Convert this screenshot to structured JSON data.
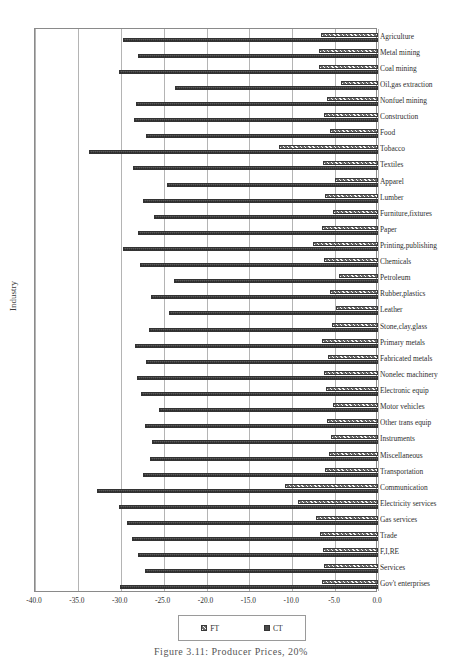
{
  "chart_data": {
    "type": "bar",
    "orientation": "horizontal",
    "title": "",
    "xlabel": "",
    "ylabel": "Industry",
    "xlim": [
      -40.0,
      0.0
    ],
    "xticks": [
      "-40.0",
      "-35.0",
      "-30.0",
      "-25.0",
      "-20.0",
      "-15.0",
      "-10.0",
      "-5.0",
      "0.0"
    ],
    "xtick_values": [
      -40,
      -35,
      -30,
      -25,
      -20,
      -15,
      -10,
      -5,
      0
    ],
    "grid": true,
    "legend_position": "below-axis",
    "categories": [
      "Agriculture",
      "Metal mining",
      "Coal mining",
      "Oil,gas extraction",
      "Nonfuel mining",
      "Construction",
      "Food",
      "Tobacco",
      "Textiles",
      "Apparel",
      "Lumber",
      "Furniture,fixtures",
      "Paper",
      "Printing,publishing",
      "Chemicals",
      "Petroleum",
      "Rubber,plastics",
      "Leather",
      "Stone,clay,glass",
      "Primary metals",
      "Fabricated metals",
      "Nonelec machinery",
      "Electronic equip",
      "Motor vehicles",
      "Other trans equip",
      "Instruments",
      "Miscellaneous",
      "Transportation",
      "Communication",
      "Electricity services",
      "Gas services",
      "Trade",
      "F,I,RE",
      "Services",
      "Gov't enterprises"
    ],
    "series": [
      {
        "name": "FT",
        "pattern": "hatched",
        "color": "#6e6e6e",
        "values": [
          -6.6,
          -6.9,
          -6.9,
          -4.3,
          -5.9,
          -6.3,
          -5.6,
          -11.5,
          -6.4,
          -5.0,
          -6.2,
          -5.3,
          -6.5,
          -7.6,
          -6.3,
          -4.6,
          -5.6,
          -4.9,
          -5.4,
          -6.5,
          -5.8,
          -6.3,
          -6.1,
          -5.3,
          -5.9,
          -5.5,
          -5.7,
          -6.2,
          -10.8,
          -9.3,
          -7.2,
          -6.8,
          -6.4,
          -6.3,
          -6.5
        ]
      },
      {
        "name": "CT",
        "pattern": "solid-checker",
        "color": "#5a5a5a",
        "values": [
          -29.7,
          -28.0,
          -30.2,
          -23.7,
          -28.2,
          -28.4,
          -27.1,
          -33.7,
          -28.6,
          -24.6,
          -27.4,
          -26.1,
          -28.0,
          -29.7,
          -27.7,
          -23.8,
          -26.5,
          -24.4,
          -26.7,
          -28.3,
          -27.0,
          -28.1,
          -27.6,
          -25.5,
          -27.2,
          -26.3,
          -26.6,
          -27.4,
          -32.8,
          -30.2,
          -29.3,
          -28.7,
          -28.0,
          -27.2,
          -30.1
        ]
      }
    ],
    "legend": [
      {
        "label": "FT",
        "swatch": "hatched-swatch"
      },
      {
        "label": "CT",
        "swatch": "solid-swatch"
      }
    ]
  },
  "caption": "Figure 3.11:  Producer Prices, 20%"
}
